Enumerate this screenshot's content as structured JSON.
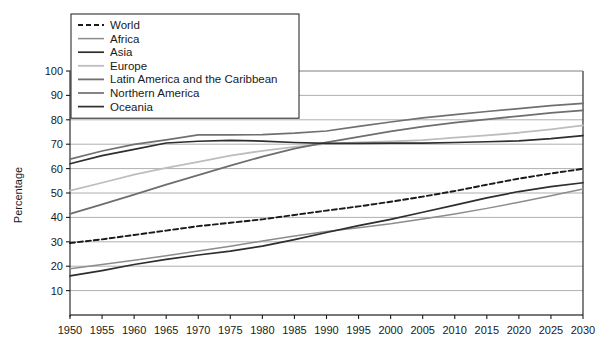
{
  "chart_data": {
    "type": "line",
    "title": "",
    "xlabel": "",
    "ylabel": "Percentage",
    "xlim": [
      1950,
      2030
    ],
    "ylim": [
      0,
      100
    ],
    "grid": "horizontal",
    "legend_position": "top-left",
    "x": [
      1950,
      1955,
      1960,
      1965,
      1970,
      1975,
      1980,
      1985,
      1990,
      1995,
      2000,
      2005,
      2010,
      2015,
      2020,
      2025,
      2030
    ],
    "x_tick_labels": [
      "1950",
      "1955",
      "1960",
      "1965",
      "1970",
      "1975",
      "1980",
      "1985",
      "1990",
      "1995",
      "2000",
      "2005",
      "2010",
      "2015",
      "2020",
      "2025",
      "2030"
    ],
    "y_tick_labels": [
      "10",
      "20",
      "30",
      "40",
      "50",
      "60",
      "70",
      "80",
      "90",
      "100"
    ],
    "y_ticks": [
      10,
      20,
      30,
      40,
      50,
      60,
      70,
      80,
      90,
      100
    ],
    "series": [
      {
        "name": "World",
        "color": "#1a1a1a",
        "dash": "5,3",
        "width": 1.9,
        "values": [
          29.5,
          31.0,
          32.8,
          34.6,
          36.4,
          37.8,
          39.2,
          41.0,
          42.8,
          44.5,
          46.4,
          48.5,
          50.8,
          53.4,
          55.9,
          58.0,
          59.9
        ]
      },
      {
        "name": "Africa",
        "color": "#8c8c8c",
        "dash": "",
        "width": 1.5,
        "values": [
          19.0,
          20.7,
          22.4,
          24.3,
          26.2,
          28.2,
          30.3,
          32.4,
          34.2,
          35.8,
          37.4,
          39.3,
          41.4,
          43.7,
          46.2,
          48.9,
          51.6
        ]
      },
      {
        "name": "Asia",
        "color": "#2e2e2e",
        "dash": "",
        "width": 1.7,
        "values": [
          16.0,
          18.2,
          20.7,
          22.8,
          24.6,
          26.2,
          28.2,
          30.9,
          33.8,
          36.6,
          39.2,
          42.1,
          45.0,
          48.0,
          50.6,
          52.6,
          54.2
        ]
      },
      {
        "name": "Europe",
        "color": "#bdbdbd",
        "dash": "",
        "width": 1.8,
        "values": [
          51.0,
          54.2,
          57.5,
          60.3,
          62.8,
          65.3,
          67.3,
          68.9,
          70.1,
          70.7,
          71.1,
          71.7,
          72.7,
          73.6,
          74.7,
          76.1,
          77.7
        ]
      },
      {
        "name": "Latin America and the Caribbean",
        "color": "#6e6e6e",
        "dash": "",
        "width": 1.8,
        "values": [
          41.4,
          45.3,
          49.3,
          53.4,
          57.3,
          61.2,
          64.9,
          68.2,
          70.7,
          73.0,
          75.3,
          77.2,
          78.8,
          80.2,
          81.5,
          82.8,
          83.9
        ]
      },
      {
        "name": "Northern America",
        "color": "#707070",
        "dash": "",
        "width": 1.7,
        "values": [
          63.9,
          67.2,
          69.9,
          71.8,
          73.8,
          73.8,
          73.9,
          74.5,
          75.4,
          77.3,
          79.1,
          80.8,
          82.1,
          83.4,
          84.6,
          85.8,
          86.7
        ]
      },
      {
        "name": "Oceania",
        "color": "#2e2e2e",
        "dash": "",
        "width": 1.7,
        "values": [
          62.0,
          65.3,
          67.9,
          70.5,
          71.2,
          71.6,
          71.3,
          70.7,
          70.3,
          70.3,
          70.4,
          70.4,
          70.7,
          71.0,
          71.4,
          72.3,
          73.5
        ]
      }
    ]
  }
}
